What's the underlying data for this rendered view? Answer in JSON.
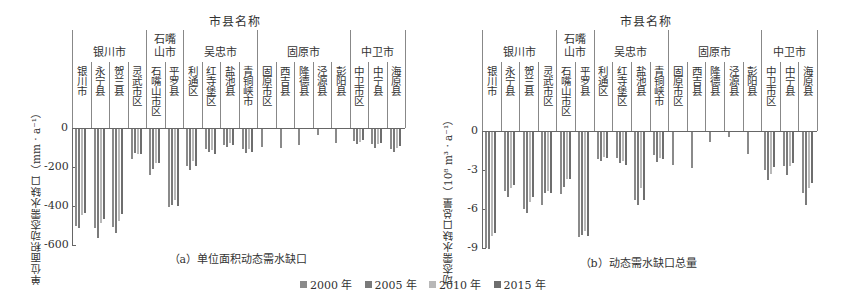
{
  "legend": [
    {
      "label": "2000 年",
      "color": "#8a8a8a"
    },
    {
      "label": "2005 年",
      "color": "#7a7a7a"
    },
    {
      "label": "2010 年",
      "color": "#b8b8b8"
    },
    {
      "label": "2015 年",
      "color": "#6e6e6e"
    }
  ],
  "header": {
    "super_title": "市县名称",
    "cities": [
      {
        "name": "银川市",
        "counties": [
          "银川市",
          "永宁县",
          "贺兰县",
          "灵武市区"
        ]
      },
      {
        "name": "石嘴山市",
        "display": [
          "石嘴",
          "山市"
        ],
        "counties": [
          "石嘴山市区",
          "平罗县"
        ]
      },
      {
        "name": "吴忠市",
        "counties": [
          "利通区",
          "红寺堡区",
          "盐池县",
          "青铜峡市"
        ]
      },
      {
        "name": "固原市",
        "counties": [
          "固原市区",
          "西吉县",
          "隆德县",
          "泾源县",
          "彭阳县"
        ]
      },
      {
        "name": "中卫市",
        "counties": [
          "中卫市区",
          "中宁县",
          "海原县"
        ]
      }
    ]
  },
  "chart_data": [
    {
      "type": "bar",
      "title": "（a）单位面积动态需水缺口",
      "xlabel": "市县名称",
      "ylabel": "单位面积动态需水缺口（mm · a⁻¹）",
      "yticks": [
        "0",
        "-200",
        "-400",
        "-600"
      ],
      "ylim": [
        -600,
        0
      ],
      "categories": [
        "银川市",
        "永宁县",
        "贺兰县",
        "灵武市区",
        "石嘴山市区",
        "平罗县",
        "利通区",
        "红寺堡区",
        "盐池县",
        "青铜峡市",
        "固原市区",
        "西吉县",
        "隆德县",
        "泾源县",
        "彭阳县",
        "中卫市区",
        "中宁县",
        "海原县"
      ],
      "series": [
        {
          "name": "2000 年",
          "values": [
            -495,
            -510,
            -505,
            -155,
            -235,
            -400,
            -190,
            -105,
            -80,
            -100,
            -90,
            -95,
            -80,
            -30,
            -70,
            -60,
            -75,
            -100
          ]
        },
        {
          "name": "2005 年",
          "values": [
            -510,
            -560,
            -535,
            -125,
            -205,
            -390,
            -210,
            -120,
            -90,
            -125,
            null,
            null,
            null,
            null,
            null,
            -75,
            -95,
            -120
          ]
        },
        {
          "name": "2010 年",
          "values": [
            -440,
            -480,
            -470,
            -130,
            -175,
            -365,
            -165,
            -110,
            -70,
            -105,
            null,
            null,
            null,
            null,
            null,
            -65,
            -75,
            -95
          ]
        },
        {
          "name": "2015 年",
          "values": [
            -430,
            -460,
            -435,
            -130,
            -175,
            -395,
            -190,
            -130,
            -80,
            -120,
            null,
            null,
            null,
            null,
            null,
            -55,
            -70,
            -85
          ]
        }
      ]
    },
    {
      "type": "bar",
      "title": "（b）动态需水缺口总量",
      "xlabel": "市县名称",
      "ylabel": "动态需水缺口总量（10⁸ m³ · a⁻¹）",
      "yticks": [
        "0",
        "-3",
        "-6",
        "-9"
      ],
      "ylim": [
        -9,
        0
      ],
      "categories": [
        "银川市",
        "永宁县",
        "贺兰县",
        "灵武市区",
        "石嘴山市区",
        "平罗县",
        "利通区",
        "红寺堡区",
        "盐池县",
        "青铜峡市",
        "固原市区",
        "西吉县",
        "隆德县",
        "泾源县",
        "彭阳县",
        "中卫市区",
        "中宁县",
        "海原县"
      ],
      "series": [
        {
          "name": "2000 年",
          "values": [
            -8.9,
            -4.5,
            -5.9,
            -5.6,
            -4.8,
            -8.1,
            -2.1,
            -2.0,
            -5.2,
            -1.8,
            -2.5,
            -2.8,
            -0.8,
            -0.4,
            -1.7,
            -2.9,
            -2.6,
            -4.7
          ]
        },
        {
          "name": "2005 年",
          "values": [
            -9.0,
            -5.0,
            -6.2,
            -4.7,
            -4.2,
            -7.9,
            -2.2,
            -2.4,
            -5.6,
            -2.3,
            null,
            null,
            null,
            null,
            null,
            -3.7,
            -3.3,
            -5.6
          ]
        },
        {
          "name": "2010 年",
          "values": [
            -8.0,
            -4.3,
            -5.4,
            -4.5,
            -3.6,
            -7.6,
            -1.9,
            -2.2,
            -4.3,
            -2.0,
            null,
            null,
            null,
            null,
            null,
            -3.2,
            -2.6,
            -4.3
          ]
        },
        {
          "name": "2015 年",
          "values": [
            -7.8,
            -4.1,
            -5.0,
            -4.7,
            -3.6,
            -8.0,
            -2.0,
            -2.5,
            -5.2,
            -2.1,
            null,
            null,
            null,
            null,
            null,
            -2.7,
            -2.4,
            -3.9
          ]
        }
      ]
    }
  ]
}
